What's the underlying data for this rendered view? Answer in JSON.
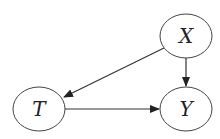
{
  "diagram": {
    "type": "causal-dag",
    "nodes": [
      {
        "id": "X",
        "label": "X",
        "cx": 186,
        "cy": 36,
        "rx": 26,
        "ry": 22
      },
      {
        "id": "T",
        "label": "T",
        "cx": 39,
        "cy": 109,
        "rx": 26,
        "ry": 22
      },
      {
        "id": "Y",
        "label": "Y",
        "cx": 186,
        "cy": 109,
        "rx": 26,
        "ry": 22
      }
    ],
    "edges": [
      {
        "from": "X",
        "to": "T"
      },
      {
        "from": "X",
        "to": "Y"
      },
      {
        "from": "T",
        "to": "Y"
      }
    ],
    "colors": {
      "stroke": "#333333",
      "background": "#ffffff"
    }
  }
}
